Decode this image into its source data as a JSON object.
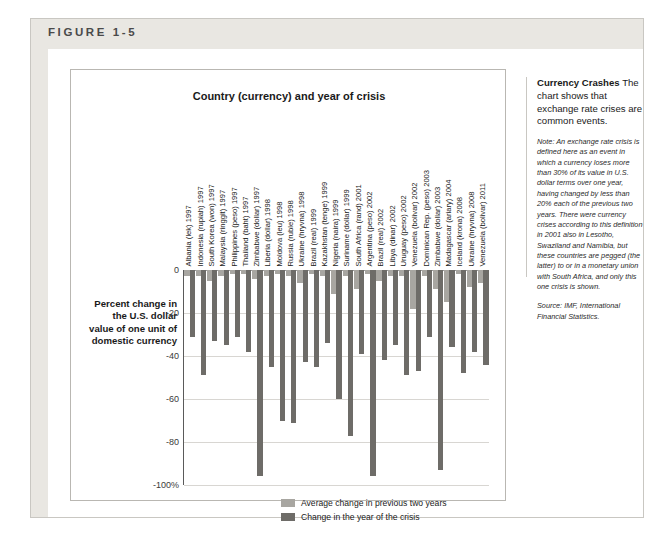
{
  "figure": {
    "number_label": "FIGURE 1-5"
  },
  "sidebar": {
    "headline": "Currency Crashes",
    "headline_body": " The chart shows that exchange rate crises are common events.",
    "note": "Note: An exchange rate crisis is defined here as an event in which a currency loses more than 30% of its value in U.S. dollar terms over one year, having changed by less than 20% each of the previous two years. There were currency crises according to this definition in 2001 also in Lesotho, Swaziland and Namibia, but these countries are pegged (the latter) to or in a monetary union with South Africa, and only this one crisis is shown.",
    "source": "Source: IMF, International Financial Statistics."
  },
  "legend": {
    "items": [
      {
        "label": "Average change in previous two years",
        "color": "#a8a6a1"
      },
      {
        "label": "Change in the year of the crisis",
        "color": "#6e6c68"
      }
    ]
  },
  "axis": {
    "y_caption": "Percent change in the U.S. dollar value of one unit of domestic currency",
    "y_ticks": [
      "0",
      "-20",
      "-40",
      "-60",
      "-80",
      "-100%"
    ]
  },
  "chart_data": {
    "type": "bar",
    "title": "Country (currency) and year of crisis",
    "xlabel": "Country (currency) and year of crisis",
    "ylabel": "Percent change in the U.S. dollar value of one unit of domestic currency",
    "ylim": [
      -100,
      0
    ],
    "yticks": [
      0,
      -20,
      -40,
      -60,
      -80,
      -100
    ],
    "grid": true,
    "legend_position": "inside-bottom-center",
    "categories": [
      "Albania (lek) 1997",
      "Indonesia (rupiah) 1997",
      "South Korea (won) 1997",
      "Malaysia (ringgit) 1997",
      "Philippines (peso) 1997",
      "Thailand (baht) 1997",
      "Zimbabwe (dollar) 1997",
      "Liberia (dollar) 1998",
      "Moldova (leu) 1998",
      "Russia (ruble) 1998",
      "Ukraine (hryvna) 1998",
      "Brazil (real) 1999",
      "Kazakhstan (tenge) 1999",
      "Nigeria (naira) 1999",
      "Suriname (dollar) 1999",
      "South Africa (rand) 2001",
      "Argentina (peso) 2002",
      "Brazil (real) 2002",
      "Libya (dinar) 2002",
      "Uruguay (peso) 2002",
      "Venezuela (bolivar) 2002",
      "Dominican Rep. (peso) 2003",
      "Zimbabwe (dollar) 2003",
      "Madagascar (ariary) 2004",
      "Iceland (krona) 2008",
      "Ukraine (hryvna) 2008",
      "Venezuela (bolivar) 2011"
    ],
    "series": [
      {
        "name": "Average change in previous two years",
        "color": "#a8a6a1",
        "values": [
          -3,
          -3,
          -5,
          -3,
          -2,
          -2,
          -4,
          -3,
          -2,
          -3,
          -6,
          -2,
          -3,
          -11,
          -3,
          -9,
          -2,
          -5,
          -3,
          -3,
          -18,
          -3,
          -9,
          -15,
          -2,
          -8,
          -6
        ]
      },
      {
        "name": "Change in the year of the crisis",
        "color": "#6e6c68",
        "values": [
          -31,
          -49,
          -33,
          -35,
          -31,
          -38,
          -96,
          -45,
          -70,
          -71,
          -43,
          -45,
          -34,
          -60,
          -77,
          -39,
          -96,
          -42,
          -35,
          -49,
          -47,
          -31,
          -93,
          -36,
          -48,
          -38,
          -44
        ]
      }
    ]
  }
}
